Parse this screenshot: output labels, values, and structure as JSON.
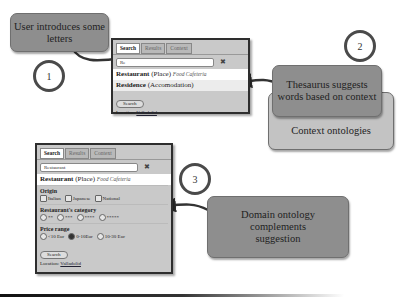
{
  "callouts": {
    "user_intro": "User introduces some letters",
    "thesaurus": "Thesaurus suggests words based on context",
    "context_ontologies": "Context ontologies",
    "domain_ontology": "Domain ontology complements suggestion"
  },
  "steps": [
    "1",
    "2",
    "3"
  ],
  "panel_top": {
    "tabs": [
      "Search",
      "Results",
      "Context"
    ],
    "search_value": "Re",
    "clear_icon": "✖",
    "suggestions": [
      {
        "term": "Restaurant",
        "category": "(Place)",
        "tags": "Food  Cafeteria"
      },
      {
        "term": "Residence",
        "category": "(Accomodation)",
        "tags": ""
      }
    ],
    "search_button": "Search",
    "location_label": "Location:",
    "location_value": "Valladolid"
  },
  "panel_bottom": {
    "tabs": [
      "Search",
      "Results",
      "Context"
    ],
    "search_value": "Restaurant",
    "clear_icon": "✖",
    "suggestion": {
      "term": "Restaurant",
      "category": "(Place)",
      "tags": "Food  Cafeteria"
    },
    "origin": {
      "title": "Origin",
      "options": [
        "Italian",
        "Japanese",
        "National"
      ]
    },
    "category": {
      "title": "Restaurant's category",
      "options": [
        "**",
        "***",
        "****",
        "*****"
      ]
    },
    "price": {
      "title": "Price range",
      "options": [
        "<10 Eur",
        "0-10Eur",
        "10-30 Eur"
      ],
      "selected": 1
    },
    "search_button": "Search",
    "location_label": "Location:",
    "location_value": "Valladolid"
  }
}
